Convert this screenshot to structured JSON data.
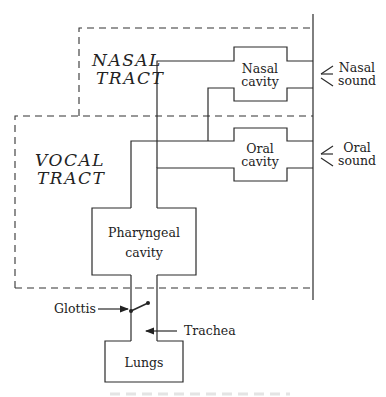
{
  "diagram": {
    "regions": {
      "nasal_tract": [
        "NASAL",
        "TRACT"
      ],
      "vocal_tract": [
        "VOCAL",
        "TRACT"
      ]
    },
    "cavities": {
      "nasal": [
        "Nasal",
        "cavity"
      ],
      "oral": [
        "Oral",
        "cavity"
      ],
      "pharyngeal": [
        "Pharyngeal",
        "cavity"
      ],
      "lungs": "Lungs"
    },
    "outputs": {
      "nasal_sound": [
        "Nasal",
        "sound"
      ],
      "oral_sound": [
        "Oral",
        "sound"
      ]
    },
    "annotations": {
      "glottis": "Glottis",
      "trachea": "Trachea"
    },
    "colors": {
      "line": "#2a2a2a",
      "background": "#ffffff"
    }
  }
}
